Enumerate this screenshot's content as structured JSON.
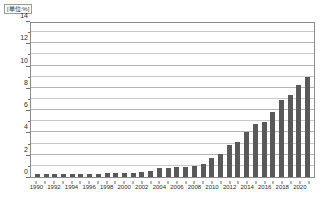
{
  "chart_data": {
    "type": "bar",
    "title": "",
    "subtitle": "",
    "unit_label": "[単位:%]",
    "xlabel": "",
    "ylabel": "",
    "ylim": [
      0,
      14
    ],
    "ytick_values": [
      0,
      2,
      4,
      6,
      8,
      10,
      12,
      14
    ],
    "ytick_labels": [
      "0",
      "2",
      "4",
      "6",
      "8",
      "10",
      "12",
      "14"
    ],
    "gridlines": {
      "major": [
        2,
        4,
        6,
        8,
        10,
        12,
        14
      ],
      "minor": [
        1,
        3,
        5,
        7,
        9,
        11,
        13
      ],
      "enabled": true
    },
    "legend": {
      "entries": [],
      "position": "none"
    },
    "bar_color": "#595959",
    "categories": [
      "1990",
      "1991",
      "1992",
      "1993",
      "1994",
      "1995",
      "1996",
      "1997",
      "1998",
      "1999",
      "2000",
      "2001",
      "2002",
      "2003",
      "2004",
      "2005",
      "2006",
      "2007",
      "2008",
      "2009",
      "2010",
      "2011",
      "2012",
      "2013",
      "2014",
      "2015",
      "2016",
      "2017",
      "2018",
      "2019",
      "2020",
      "2021"
    ],
    "xtick_labels": [
      "1990",
      "",
      "1992",
      "",
      "1994",
      "",
      "1996",
      "",
      "1998",
      "",
      "2000",
      "",
      "2002",
      "",
      "2004",
      "",
      "2006",
      "",
      "2008",
      "",
      "2010",
      "",
      "2012",
      "",
      "2014",
      "",
      "2016",
      "",
      "2018",
      "",
      "2020",
      ""
    ],
    "values": [
      0.3,
      0.3,
      0.3,
      0.25,
      0.25,
      0.3,
      0.3,
      0.3,
      0.35,
      0.35,
      0.4,
      0.4,
      0.45,
      0.5,
      0.8,
      0.85,
      0.9,
      0.9,
      1.0,
      1.2,
      1.75,
      2.1,
      2.85,
      3.1,
      4.05,
      4.8,
      4.95,
      5.85,
      6.9,
      7.4,
      8.3,
      9.0
    ],
    "values_display": [
      0.3,
      0.3,
      0.3,
      0.25,
      0.25,
      0.3,
      0.3,
      0.3,
      0.35,
      0.35,
      0.4,
      0.4,
      0.45,
      0.5,
      0.8,
      0.85,
      0.9,
      0.9,
      1.0,
      1.2,
      1.75,
      2.1,
      2.85,
      3.1,
      4.05,
      4.8,
      4.95,
      5.85,
      6.9,
      7.4,
      8.3,
      9.0
    ],
    "series": [
      {
        "name": "",
        "values": [
          0.3,
          0.3,
          0.3,
          0.25,
          0.25,
          0.3,
          0.3,
          0.3,
          0.35,
          0.35,
          0.4,
          0.4,
          0.45,
          0.5,
          0.8,
          0.85,
          0.9,
          0.9,
          1.0,
          1.2,
          1.75,
          2.1,
          2.85,
          3.1,
          4.05,
          4.8,
          4.95,
          5.85,
          6.9,
          7.4,
          8.3,
          9.0
        ]
      }
    ]
  }
}
